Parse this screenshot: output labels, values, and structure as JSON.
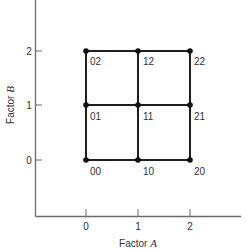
{
  "diagram": {
    "type": "factorial-design-grid",
    "x_axis": {
      "label_prefix": "Factor ",
      "label_var": "A",
      "ticks": [
        "0",
        "1",
        "2"
      ]
    },
    "y_axis": {
      "label_prefix": "Factor ",
      "label_var": "B",
      "ticks": [
        "0",
        "1",
        "2"
      ]
    },
    "points": [
      {
        "a": 0,
        "b": 0,
        "label": "00"
      },
      {
        "a": 1,
        "b": 0,
        "label": "10"
      },
      {
        "a": 2,
        "b": 0,
        "label": "20"
      },
      {
        "a": 0,
        "b": 1,
        "label": "01"
      },
      {
        "a": 1,
        "b": 1,
        "label": "11"
      },
      {
        "a": 2,
        "b": 1,
        "label": "21"
      },
      {
        "a": 0,
        "b": 2,
        "label": "02"
      },
      {
        "a": 1,
        "b": 2,
        "label": "12"
      },
      {
        "a": 2,
        "b": 2,
        "label": "22"
      }
    ],
    "colors": {
      "axis": "#6a6a6a",
      "grid": "#1e1e1e",
      "text": "#333333"
    }
  }
}
